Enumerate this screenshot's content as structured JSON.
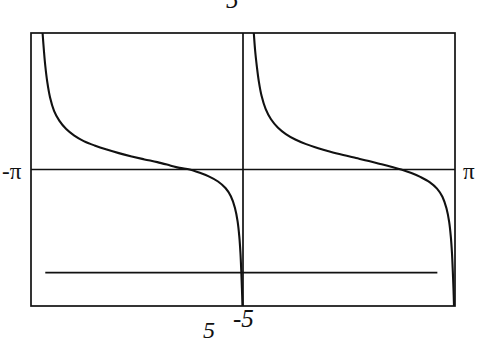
{
  "figure": {
    "kind": "function-graph",
    "background_color": "#ffffff",
    "line_color": "#111111",
    "frame": {
      "x_left_px": 31,
      "x_right_px": 455,
      "y_top_px": 33,
      "y_bottom_px": 306,
      "stroke_width": 1.6
    }
  },
  "labels": {
    "y_max": "5",
    "y_min": "-5",
    "x_min": "-π",
    "x_max": "π",
    "bottom_extra": "5"
  },
  "chart_data": {
    "type": "line",
    "title": "",
    "xlabel": "",
    "ylabel": "",
    "xlim": [
      -3.14159265,
      3.14159265
    ],
    "ylim": [
      -5,
      5
    ],
    "xtick_labels": [
      "-π",
      "π"
    ],
    "ytick_labels": [
      "5",
      "-5"
    ],
    "grid": false,
    "legend": null,
    "axes": {
      "x_axis_line_y": 0,
      "y_axis_line_x": 0,
      "x_axis_drawn": true,
      "y_axis_drawn": true
    },
    "annotations": [
      {
        "name": "lower-horizontal-line",
        "description": "horizontal reference line drawn across the plot below the x-axis",
        "y_value": -3.78,
        "x_start": -2.93,
        "x_end": 2.88
      }
    ],
    "series": [
      {
        "name": "branch-left",
        "description": "decreasing branch with vertical asymptote near x = -2.97 and a zero crossing at x = -0.79",
        "points": [
          [
            -2.97,
            5.0
          ],
          [
            -2.95,
            4.35
          ],
          [
            -2.93,
            3.8
          ],
          [
            -2.9,
            3.2
          ],
          [
            -2.86,
            2.65
          ],
          [
            -2.8,
            2.15
          ],
          [
            -2.72,
            1.78
          ],
          [
            -2.62,
            1.48
          ],
          [
            -2.5,
            1.24
          ],
          [
            -2.36,
            1.04
          ],
          [
            -2.2,
            0.88
          ],
          [
            -2.02,
            0.73
          ],
          [
            -1.84,
            0.6
          ],
          [
            -1.65,
            0.48
          ],
          [
            -1.46,
            0.37
          ],
          [
            -1.27,
            0.27
          ],
          [
            -1.08,
            0.15
          ],
          [
            -0.94,
            0.06
          ],
          [
            -0.79,
            0.0
          ],
          [
            -0.64,
            -0.12
          ],
          [
            -0.5,
            -0.26
          ],
          [
            -0.37,
            -0.44
          ],
          [
            -0.26,
            -0.68
          ],
          [
            -0.18,
            -0.98
          ],
          [
            -0.12,
            -1.4
          ],
          [
            -0.08,
            -1.9
          ],
          [
            -0.055,
            -2.45
          ],
          [
            -0.038,
            -3.05
          ],
          [
            -0.026,
            -3.7
          ],
          [
            -0.016,
            -4.35
          ],
          [
            -0.008,
            -5.0
          ]
        ]
      },
      {
        "name": "branch-right",
        "description": "decreasing branch with vertical asymptote near x = 0.16 and a zero crossing at x = 2.34",
        "points": [
          [
            0.16,
            5.0
          ],
          [
            0.18,
            4.35
          ],
          [
            0.205,
            3.78
          ],
          [
            0.235,
            3.22
          ],
          [
            0.275,
            2.7
          ],
          [
            0.335,
            2.22
          ],
          [
            0.415,
            1.84
          ],
          [
            0.515,
            1.54
          ],
          [
            0.635,
            1.3
          ],
          [
            0.775,
            1.1
          ],
          [
            0.935,
            0.93
          ],
          [
            1.115,
            0.78
          ],
          [
            1.295,
            0.65
          ],
          [
            1.485,
            0.53
          ],
          [
            1.675,
            0.42
          ],
          [
            1.865,
            0.31
          ],
          [
            2.055,
            0.19
          ],
          [
            2.195,
            0.1
          ],
          [
            2.345,
            0.0
          ],
          [
            2.495,
            -0.13
          ],
          [
            2.635,
            -0.28
          ],
          [
            2.765,
            -0.46
          ],
          [
            2.875,
            -0.7
          ],
          [
            2.955,
            -1.0
          ],
          [
            3.015,
            -1.42
          ],
          [
            3.055,
            -1.92
          ],
          [
            3.08,
            -2.47
          ],
          [
            3.097,
            -3.07
          ],
          [
            3.109,
            -3.72
          ],
          [
            3.119,
            -4.37
          ],
          [
            3.127,
            -5.0
          ]
        ]
      }
    ]
  }
}
